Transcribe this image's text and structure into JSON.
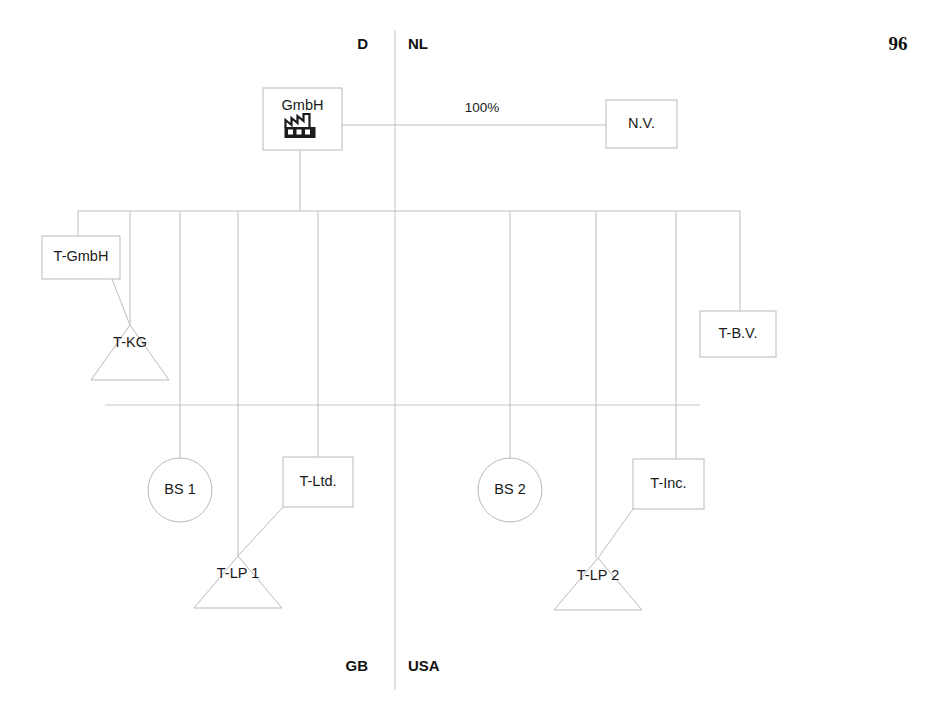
{
  "page": {
    "number": "96",
    "background_color": "#ffffff",
    "line_color": "#bdbdbd",
    "text_color": "#1a1a1a"
  },
  "diagram": {
    "type": "corporate-group-structure",
    "country_labels": [
      {
        "id": "label-d",
        "text": "D",
        "x": 368,
        "y": 45,
        "align": "left-of-line"
      },
      {
        "id": "label-nl",
        "text": "NL",
        "x": 408,
        "y": 45,
        "align": "right-of-line"
      },
      {
        "id": "label-gb",
        "text": "GB",
        "x": 368,
        "y": 667,
        "align": "left-of-line"
      },
      {
        "id": "label-usa",
        "text": "USA",
        "x": 408,
        "y": 667,
        "align": "right-of-line"
      }
    ],
    "dividers": [
      {
        "id": "vertical-country-divider",
        "orientation": "vertical",
        "x1": 395,
        "y1": 30,
        "x2": 395,
        "y2": 690
      },
      {
        "id": "horizontal-country-divider",
        "orientation": "horizontal",
        "x1": 105,
        "y1": 405,
        "x2": 700,
        "y2": 405
      }
    ],
    "nodes": [
      {
        "id": "gmbh",
        "label": "GmbH",
        "shape": "rect-with-icon",
        "icon": "factory-icon",
        "x": 263,
        "y": 88,
        "w": 79,
        "h": 62,
        "label_dy": -13
      },
      {
        "id": "nv",
        "label": "N.V.",
        "shape": "rect",
        "x": 606,
        "y": 100,
        "w": 71,
        "h": 48
      },
      {
        "id": "t-gmbh",
        "label": "T-GmbH",
        "shape": "rect",
        "x": 42,
        "y": 236,
        "w": 78,
        "h": 43
      },
      {
        "id": "t-bv",
        "label": "T-B.V.",
        "shape": "rect",
        "x": 700,
        "y": 311,
        "w": 76,
        "h": 46
      },
      {
        "id": "t-kg",
        "label": "T-KG",
        "shape": "triangle",
        "cx": 130,
        "cy": 325,
        "half_base": 39,
        "height": 55,
        "label_dy": 18
      },
      {
        "id": "bs1",
        "label": "BS 1",
        "shape": "circle",
        "cx": 180,
        "cy": 490,
        "r": 32
      },
      {
        "id": "t-ltd",
        "label": "T-Ltd.",
        "shape": "rect",
        "x": 283,
        "y": 457,
        "w": 70,
        "h": 50
      },
      {
        "id": "bs2",
        "label": "BS 2",
        "shape": "circle",
        "cx": 510,
        "cy": 490,
        "r": 32
      },
      {
        "id": "t-inc",
        "label": "T-Inc.",
        "shape": "rect",
        "x": 633,
        "y": 459,
        "w": 71,
        "h": 50
      },
      {
        "id": "t-lp1",
        "label": "T-LP 1",
        "shape": "triangle",
        "cx": 238,
        "cy": 556,
        "half_base": 44,
        "height": 52,
        "label_dy": 18
      },
      {
        "id": "t-lp2",
        "label": "T-LP 2",
        "shape": "triangle",
        "cx": 598,
        "cy": 558,
        "half_base": 44,
        "height": 52,
        "label_dy": 18
      }
    ],
    "edges": [
      {
        "id": "edge-gmbh-nv",
        "from": "gmbh",
        "to": "nv",
        "label": "100%",
        "label_x": 482,
        "label_y": 108,
        "points": "342,125 606,125"
      },
      {
        "id": "edge-gmbh-bus",
        "from": "gmbh",
        "to": "bus",
        "label": "",
        "points": "300,150 300,211"
      },
      {
        "id": "edge-bus-main",
        "from": "bus",
        "to": "bus",
        "label": "",
        "points": "78,211 740,211"
      },
      {
        "id": "edge-bus-tgmbh",
        "from": "bus",
        "to": "t-gmbh",
        "label": "",
        "points": "78,211 78,236"
      },
      {
        "id": "edge-tgmbh-tkg",
        "from": "t-gmbh",
        "to": "t-kg",
        "label": "",
        "points": "112,279 130,325"
      },
      {
        "id": "edge-bus-tkg",
        "from": "bus",
        "to": "t-kg",
        "label": "",
        "points": "130,211 130,325"
      },
      {
        "id": "edge-bus-bs1",
        "from": "bus",
        "to": "bs1",
        "label": "",
        "points": "180,211 180,458"
      },
      {
        "id": "edge-bus-tlp1",
        "from": "bus",
        "to": "t-lp1",
        "label": "",
        "points": "238,211 238,556"
      },
      {
        "id": "edge-bus-tltd",
        "from": "bus",
        "to": "t-ltd",
        "label": "",
        "points": "318,211 318,457"
      },
      {
        "id": "edge-tltd-tlp1",
        "from": "t-ltd",
        "to": "t-lp1",
        "label": "",
        "points": "283,507 238,556"
      },
      {
        "id": "edge-bus-bs2",
        "from": "bus",
        "to": "bs2",
        "label": "",
        "points": "510,211 510,458"
      },
      {
        "id": "edge-bus-tlp2",
        "from": "bus",
        "to": "t-lp2",
        "label": "",
        "points": "596,211 596,558"
      },
      {
        "id": "edge-bus-tinc",
        "from": "bus",
        "to": "t-inc",
        "label": "",
        "points": "676,211 676,459"
      },
      {
        "id": "edge-tinc-tlp2",
        "from": "t-inc",
        "to": "t-lp2",
        "label": "",
        "points": "633,509 598,558"
      },
      {
        "id": "edge-bus-tbv",
        "from": "bus",
        "to": "t-bv",
        "label": "",
        "points": "740,211 740,311"
      }
    ]
  }
}
